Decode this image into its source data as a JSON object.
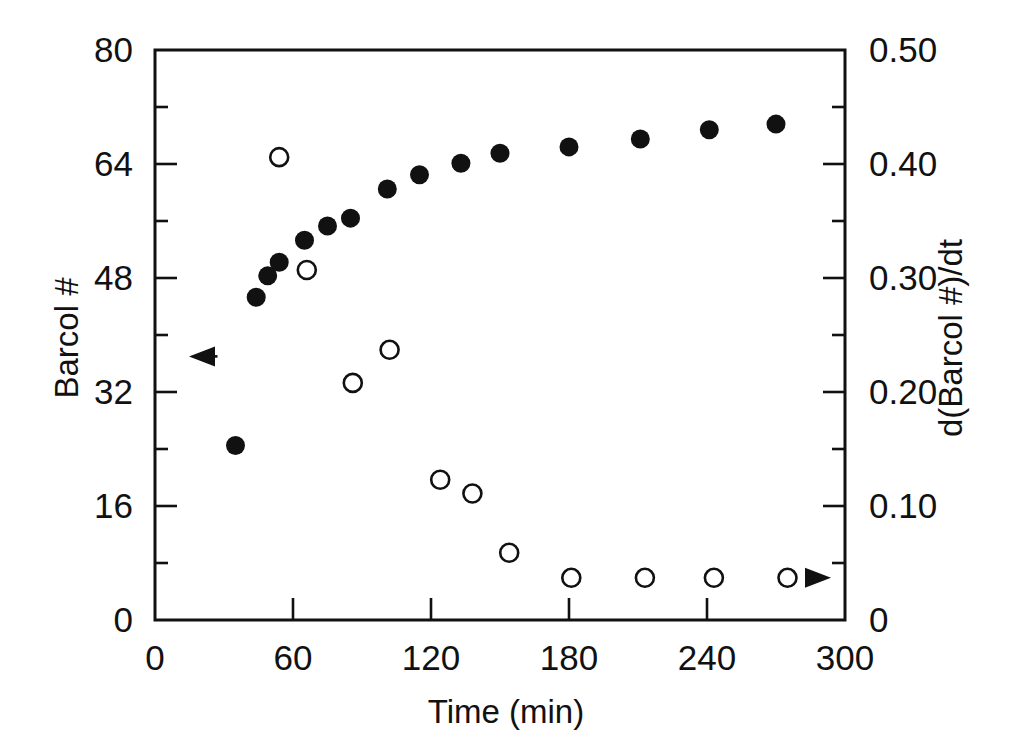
{
  "chart_data": {
    "type": "scatter",
    "title": "",
    "xlabel": "Time (min)",
    "ylabel": "Barcol #",
    "y2label": "d(Barcol #)/dt",
    "xlim": [
      0,
      300
    ],
    "ylim": [
      0,
      80
    ],
    "y2lim": [
      0,
      0.5
    ],
    "grid": false,
    "legend_position": "none",
    "xticks": [
      0,
      60,
      120,
      180,
      240,
      300
    ],
    "xticklabels": [
      "0",
      "60",
      "120",
      "180",
      "240",
      "300"
    ],
    "xminorticks": [
      30,
      90,
      150,
      210,
      270
    ],
    "yticks": [
      0,
      16,
      32,
      48,
      64,
      80
    ],
    "yticklabels": [
      "0",
      "16",
      "32",
      "48",
      "64",
      "80"
    ],
    "yminorticks": [
      8,
      24,
      40,
      56,
      72
    ],
    "y2ticks": [
      0,
      0.1,
      0.2,
      0.3,
      0.4,
      0.5
    ],
    "y2ticklabels": [
      "0",
      "0.10",
      "0.20",
      "0.30",
      "0.40",
      "0.50"
    ],
    "y2minorticks": [
      0.05,
      0.15,
      0.25,
      0.35,
      0.45
    ],
    "annotations": [
      {
        "name": "left-axis-arrow",
        "text": "",
        "direction": "left",
        "x": 35,
        "y": 37,
        "describes": "filled-circles-series"
      },
      {
        "name": "right-axis-arrow",
        "text": "",
        "direction": "right",
        "x": 285,
        "y2": 0.037,
        "describes": "open-circles-series"
      }
    ],
    "series": [
      {
        "name": "Barcol #",
        "marker": "filled-circle",
        "axis": "left",
        "color": "#111111",
        "x": [
          35,
          44,
          49,
          54,
          65,
          75,
          85,
          101,
          115,
          133,
          150,
          180,
          211,
          241,
          270
        ],
        "y": [
          24.5,
          45.3,
          48.3,
          50.2,
          53.3,
          55.3,
          56.4,
          60.5,
          62.5,
          64.1,
          65.5,
          66.4,
          67.5,
          68.8,
          69.6
        ]
      },
      {
        "name": "d(Barcol #)/dt",
        "marker": "open-circle",
        "axis": "right",
        "color": "#111111",
        "x": [
          54,
          66,
          86,
          102,
          124,
          138,
          154,
          181,
          213,
          243,
          275
        ],
        "y": [
          0.406,
          0.307,
          0.208,
          0.237,
          0.123,
          0.111,
          0.059,
          0.037,
          0.037,
          0.037,
          0.037
        ]
      }
    ]
  },
  "figure": {
    "background_color": "#ffffff",
    "foreground_color": "#111111"
  }
}
